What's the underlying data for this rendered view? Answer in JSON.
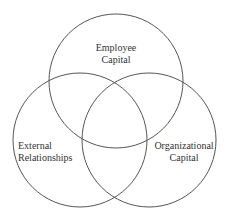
{
  "diagram": {
    "type": "venn",
    "stroke_color": "#555555",
    "text_color": "#333333",
    "circles": [
      {
        "id": "employee-capital",
        "cx": 116,
        "cy": 81,
        "r": 67
      },
      {
        "id": "external-relationships",
        "cx": 80,
        "cy": 140,
        "r": 67
      },
      {
        "id": "organizational-capital",
        "cx": 149,
        "cy": 140,
        "r": 67
      }
    ],
    "labels": {
      "employee_capital": {
        "line1": "Employee",
        "line2": "Capital"
      },
      "external_relationships": {
        "line1": "External",
        "line2": "Relationships"
      },
      "organizational_capital": {
        "line1": "Organizational",
        "line2": "Capital"
      }
    }
  }
}
